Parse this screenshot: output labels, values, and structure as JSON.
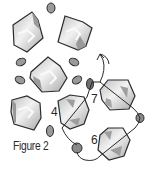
{
  "figure": {
    "caption": "Figure 2",
    "step_labels": {
      "four": "4",
      "six": "6",
      "seven": "7"
    },
    "colors": {
      "outline": "#2b2b2b",
      "crystal_light": "#ececec",
      "crystal_mid": "#c8c8c8",
      "crystal_dark": "#9a9a9a",
      "bead_fill": "#8f8f8f",
      "thread": "#2b2b2b"
    },
    "elements": {
      "crystals": 7,
      "seed_beads": 8,
      "thread_path_arrow": "up"
    }
  }
}
